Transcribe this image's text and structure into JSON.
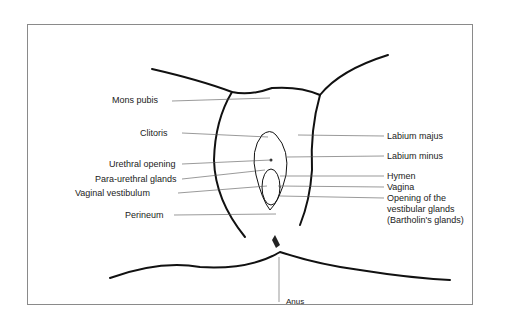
{
  "diagram": {
    "type": "labeled anatomical illustration",
    "labels_left": [
      {
        "text": "Mons pubis",
        "x": 112,
        "y": 65
      },
      {
        "text": "Clitoris",
        "x": 140,
        "y": 128
      },
      {
        "text": "Urethral opening",
        "x": 109,
        "y": 159
      },
      {
        "text": "Para-urethral glands",
        "x": 95,
        "y": 175
      },
      {
        "text": "Vaginal vestibulum",
        "x": 75,
        "y": 189
      },
      {
        "text": "Perineum",
        "x": 125,
        "y": 210
      }
    ],
    "labels_right": [
      {
        "text": "Labium majus",
        "x": 387,
        "y": 131
      },
      {
        "text": "Labium minus",
        "x": 387,
        "y": 151
      },
      {
        "text": "Hymen",
        "x": 387,
        "y": 172
      },
      {
        "text": "Vagina",
        "x": 387,
        "y": 184
      },
      {
        "text": "Opening of the",
        "x": 387,
        "y": 195
      },
      {
        "text": "vestibular glands",
        "x": 387,
        "y": 206
      },
      {
        "text": "(Bartholin's glands)",
        "x": 387,
        "y": 217
      }
    ],
    "label_bottom": {
      "text": "Anus",
      "x": 286,
      "y": 297
    }
  }
}
